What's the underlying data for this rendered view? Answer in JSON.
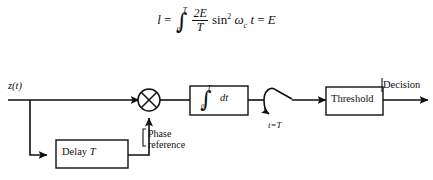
{
  "figure": {
    "title_equation": {
      "lhs": "l",
      "equals": "=",
      "integral_lower": "0",
      "integral_upper": "T",
      "fraction_numerator": "2E",
      "fraction_denominator": "T",
      "sin_text": "sin",
      "sin_power": "2",
      "omega": "ω",
      "omega_subscript": "c",
      "variable": "t",
      "equals2": "=",
      "rhs": "E",
      "plain": "l = ∫₀ᵀ (2E/T) sin² ωc t = E"
    },
    "labels": {
      "input_signal": "z(t)",
      "delay_block": "Delay T",
      "delay_block_text": "Delay",
      "delay_block_param": "T",
      "phase_reference_line1": "Phase",
      "phase_reference_line2": "reference",
      "sampler": "t=T",
      "threshold_block": "Threshold",
      "output": "Decision",
      "integrator_lower": "0",
      "integrator_upper": "T",
      "integrator_dt": "dt"
    },
    "colors": {
      "stroke": "#111111",
      "background": "#ffffff",
      "text": "#111111"
    },
    "nodes": [
      {
        "id": "multiplier",
        "type": "multiplier-circle",
        "symbol": "x"
      },
      {
        "id": "integrator",
        "type": "block",
        "label": "∫₀ᵀ dt"
      },
      {
        "id": "sampler",
        "type": "switch",
        "label": "t=T"
      },
      {
        "id": "threshold",
        "type": "block",
        "label": "Threshold"
      },
      {
        "id": "delay",
        "type": "block",
        "label": "Delay T"
      }
    ]
  }
}
